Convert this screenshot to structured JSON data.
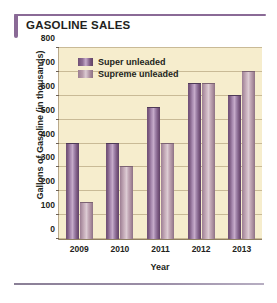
{
  "title": "GASOLINE SALES",
  "accent_color": "#8a6a96",
  "plot_background": "#f6edcd",
  "chart_data": {
    "type": "bar",
    "title": "GASOLINE SALES",
    "xlabel": "Year",
    "ylabel": "Gallons of Gasoline (in thousands)",
    "categories": [
      "2009",
      "2010",
      "2011",
      "2012",
      "2013"
    ],
    "series": [
      {
        "name": "Super unleaded",
        "color": "#8e6d94",
        "values": [
          400,
          400,
          550,
          650,
          600
        ]
      },
      {
        "name": "Supreme unleaded",
        "color": "#b89cab",
        "values": [
          150,
          300,
          400,
          650,
          700
        ]
      }
    ],
    "ylim": [
      0,
      800
    ],
    "yticks": [
      0,
      100,
      200,
      300,
      400,
      500,
      600,
      700,
      800
    ],
    "grid": true,
    "legend_position": "top-left"
  }
}
